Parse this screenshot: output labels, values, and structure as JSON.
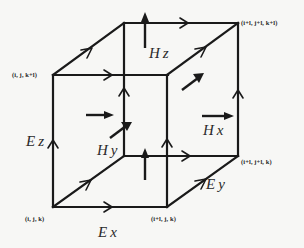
{
  "diagram": {
    "line_color": "#1a1a1a",
    "background": "#f7f7f5",
    "vertices": [
      {
        "id": "v000",
        "label": "(i, j, k)"
      },
      {
        "id": "v100",
        "label": "(i+l, j, k)"
      },
      {
        "id": "v110",
        "label": "(i+l, j+l, k)"
      },
      {
        "id": "v001",
        "label": "(i, j, k+l)"
      },
      {
        "id": "v111",
        "label": "(i+l, j+l, k+l)"
      }
    ],
    "field_labels": {
      "ex": "Ex",
      "ey": "Ey",
      "ez": "Ez",
      "hx": "Hx",
      "hy": "Hy",
      "hz": "Hz"
    }
  }
}
